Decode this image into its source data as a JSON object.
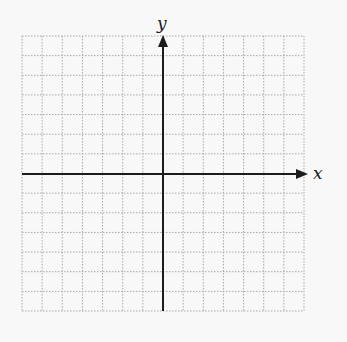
{
  "diagram": {
    "type": "coordinate-plane",
    "grid": {
      "left": 22,
      "top": 36,
      "right": 304,
      "bottom": 311,
      "columns": 14,
      "rows": 14,
      "line_color": "#a8a8a8",
      "line_style": "dotted"
    },
    "axes": {
      "color": "#1c1c1c",
      "origin_px": {
        "x": 163,
        "y": 174
      },
      "x_axis": {
        "label": "x",
        "arrow": "right"
      },
      "y_axis": {
        "label": "y",
        "arrow": "up"
      }
    },
    "background": "#f8f8f8"
  }
}
